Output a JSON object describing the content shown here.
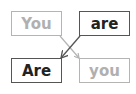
{
  "diagram": {
    "boxes": [
      {
        "id": "top-left",
        "label": "You",
        "style": "light"
      },
      {
        "id": "top-right",
        "label": "are",
        "style": "dark"
      },
      {
        "id": "bottom-left",
        "label": "Are",
        "style": "dark"
      },
      {
        "id": "bottom-right",
        "label": "you",
        "style": "light"
      }
    ],
    "arrows": [
      {
        "from": "You",
        "to": "you",
        "color": "#b4b4b4"
      },
      {
        "from": "are",
        "to": "Are",
        "color": "#555555"
      }
    ]
  }
}
